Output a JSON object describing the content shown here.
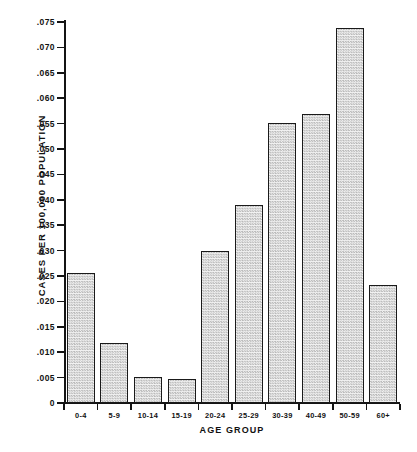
{
  "chart_data": {
    "type": "bar",
    "title": "",
    "xlabel": "AGE GROUP",
    "ylabel": "CASES PER 100,000 POPULATION",
    "categories": [
      "0-4",
      "5-9",
      "10-14",
      "15-19",
      "20-24",
      "25-29",
      "30-39",
      "40-49",
      "50-59",
      "60+"
    ],
    "values": [
      0.0255,
      0.0118,
      0.0052,
      0.0048,
      0.03,
      0.039,
      0.0552,
      0.0568,
      0.0738,
      0.0232
    ],
    "ylim": [
      0,
      0.075
    ],
    "ytick_values": [
      0,
      0.005,
      0.01,
      0.015,
      0.02,
      0.025,
      0.03,
      0.035,
      0.04,
      0.045,
      0.05,
      0.055,
      0.06,
      0.065,
      0.07,
      0.075
    ],
    "ytick_labels": [
      "0",
      ".005",
      ".010",
      ".015",
      ".020",
      ".025",
      ".030",
      ".035",
      ".040",
      ".045",
      ".050",
      ".055",
      ".060",
      ".065",
      ".070",
      ".075"
    ],
    "grid": false,
    "legend": null,
    "bar_fill": "#e8e8e8",
    "bar_edge": "#1a1a1a",
    "axis_color": "#141414",
    "background": "#ffffff"
  }
}
